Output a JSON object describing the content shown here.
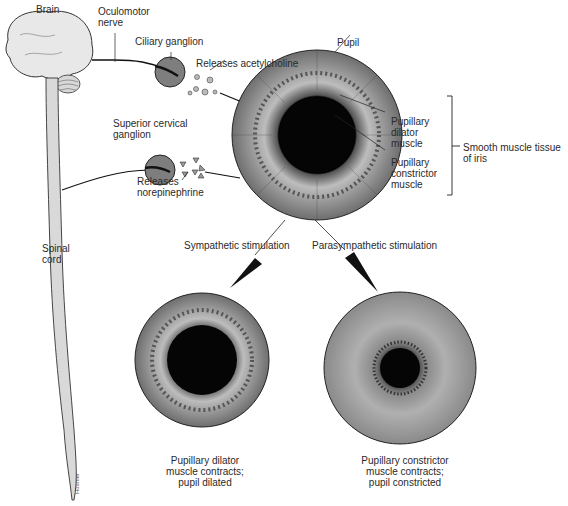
{
  "labels": {
    "brain": "Brain",
    "oculomotor_nerve": [
      "Oculomotor",
      "nerve"
    ],
    "ciliary_ganglion": "Ciliary ganglion",
    "releases_acetylcholine": "Releases acetylcholine",
    "pupil": "Pupil",
    "superior_cervical_ganglion": [
      "Superior cervical",
      "ganglion"
    ],
    "releases_norepinephrine": [
      "Releases",
      "norepinephrine"
    ],
    "pupillary_dilator_muscle": [
      "Pupillary",
      "dilator",
      "muscle"
    ],
    "pupillary_constrictor_muscle": [
      "Pupillary",
      "constrictor",
      "muscle"
    ],
    "smooth_muscle_tissue": [
      "Smooth muscle tissue",
      "of iris"
    ],
    "spinal_cord": [
      "Spinal",
      "cord"
    ],
    "sympathetic_stimulation": "Sympathetic stimulation",
    "parasympathetic_stimulation": "Parasympathetic stimulation",
    "dilated_caption": [
      "Pupillary dilator",
      "muscle contracts;",
      "pupil dilated"
    ],
    "constricted_caption": [
      "Pupillary constrictor",
      "muscle contracts;",
      "pupil constricted"
    ],
    "signature": "Hosmer"
  },
  "colors": {
    "ink": "#1a1a1a",
    "iris_gray": "#8a8a8a",
    "iris_light": "#c8c8c8",
    "pupil_black": "#0a0a0a",
    "ganglion_gray": "#7a7a7a",
    "brain_fill": "#e6e6e6"
  }
}
